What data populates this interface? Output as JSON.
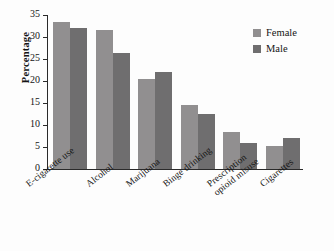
{
  "chart_data": {
    "type": "bar",
    "title": "",
    "subtitle": "",
    "xlabel": "",
    "ylabel": "Percentage",
    "ylim": [
      0,
      35
    ],
    "yticks": [
      0,
      5,
      10,
      15,
      20,
      25,
      30,
      35
    ],
    "ytick_labels": [
      "0",
      "5",
      "10",
      "15",
      "20",
      "25",
      "30",
      "35"
    ],
    "grid": false,
    "legend_position": "top-right",
    "categories": [
      "E-cigarette use",
      "Alcohol",
      "Marijuana",
      "Binge drinking",
      "Prescription\nopioid misuse",
      "Cigarettes"
    ],
    "series": [
      {
        "name": "Female",
        "color": "#918f90",
        "values": [
          33.5,
          31.5,
          20.5,
          14.5,
          8.5,
          5.2
        ]
      },
      {
        "name": "Male",
        "color": "#6f6e6f",
        "values": [
          32.0,
          26.3,
          22.0,
          12.5,
          6.0,
          7.0
        ]
      }
    ],
    "annotations": []
  },
  "legend": {
    "items": [
      {
        "label": "Female",
        "color": "#918f90"
      },
      {
        "label": "Male",
        "color": "#6f6e6f"
      }
    ]
  },
  "colors": {
    "axis": "#2a2a2a",
    "text": "#151515",
    "background": "#fdfdfd",
    "female": "#918f90",
    "male": "#6f6e6f"
  }
}
